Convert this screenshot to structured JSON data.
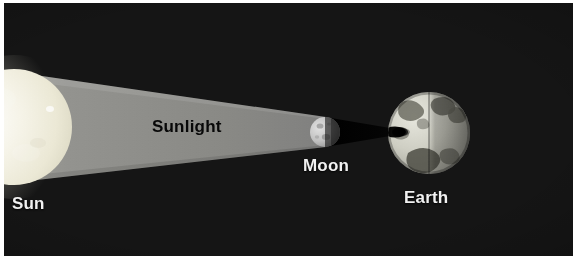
{
  "diagram": {
    "background_color": "#151515",
    "border_color": "#ffffff",
    "labels": {
      "sun": "Sun",
      "sunlight": "Sunlight",
      "moon": "Moon",
      "earth": "Earth"
    }
  },
  "bodies": {
    "sun": {
      "name": "Sun",
      "color": "#f3f0e2",
      "center_x": 10,
      "center_y": 124,
      "radius": 58
    },
    "moon": {
      "name": "Moon",
      "color": "#b9b9b9",
      "center_x": 321,
      "center_y": 129,
      "radius": 15
    },
    "earth": {
      "name": "Earth",
      "color": "#cfcfc6",
      "center_x": 425,
      "center_y": 130,
      "radius": 41
    }
  },
  "light": {
    "beam_label": "Sunlight",
    "beam_color": "#8d8d8d",
    "umbra_color": "#0a0a0a"
  }
}
